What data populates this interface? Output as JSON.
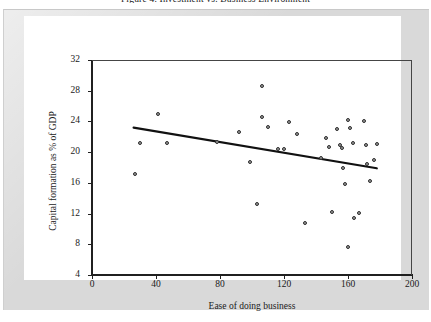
{
  "figure": {
    "title": "Figure 4. Investment vs. Business Environment",
    "caption_visible": "partially-cropped-top-edge"
  },
  "chart_data": {
    "type": "scatter",
    "title": "Figure 4. Investment vs. Business Environment",
    "xlabel": "Ease of doing business",
    "ylabel": "Capital formation as % of GDP",
    "xlim": [
      0,
      200
    ],
    "ylim": [
      4,
      32
    ],
    "xticks": [
      0,
      40,
      80,
      120,
      160,
      200
    ],
    "yticks": [
      4,
      8,
      12,
      16,
      20,
      24,
      28,
      32
    ],
    "grid": false,
    "legend": null,
    "points": [
      [
        27,
        17.1
      ],
      [
        30,
        21.2
      ],
      [
        41,
        25.0
      ],
      [
        47,
        21.2
      ],
      [
        78,
        21.3
      ],
      [
        92,
        22.6
      ],
      [
        99,
        18.7
      ],
      [
        103,
        13.3
      ],
      [
        106,
        28.6
      ],
      [
        106,
        24.6
      ],
      [
        110,
        23.3
      ],
      [
        116,
        20.4
      ],
      [
        120,
        20.4
      ],
      [
        123,
        23.9
      ],
      [
        128,
        22.3
      ],
      [
        133,
        10.8
      ],
      [
        143,
        19.3
      ],
      [
        146,
        21.9
      ],
      [
        148,
        20.7
      ],
      [
        150,
        12.2
      ],
      [
        153,
        23.0
      ],
      [
        155,
        20.9
      ],
      [
        156,
        20.6
      ],
      [
        157,
        17.9
      ],
      [
        158,
        15.8
      ],
      [
        160,
        24.2
      ],
      [
        160,
        7.7
      ],
      [
        161,
        23.1
      ],
      [
        163,
        21.2
      ],
      [
        164,
        11.4
      ],
      [
        167,
        12.1
      ],
      [
        170,
        24.0
      ],
      [
        171,
        20.9
      ],
      [
        172,
        18.5
      ],
      [
        174,
        16.3
      ],
      [
        176,
        19.0
      ],
      [
        178,
        21.0
      ]
    ],
    "trendline": {
      "type": "linear-fit",
      "x_start": 26,
      "y_start": 23.2,
      "x_end": 178,
      "y_end": 17.9,
      "direction": "negative"
    }
  },
  "style": {
    "frame_color": "#d9d9d9",
    "card_color": "#ffffff",
    "axis_color": "#202020",
    "marker_fill": "#9a9a9a",
    "marker_edge": "#2e2e2e",
    "trend_color": "#111111"
  }
}
